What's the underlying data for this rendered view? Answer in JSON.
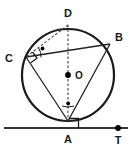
{
  "figure": {
    "type": "circle-geometry-diagram",
    "colors": {
      "stroke": "#222222",
      "circle_stroke": "#1a1a1a",
      "background": "#ffffff",
      "point_fill": "#000000"
    },
    "circle": {
      "label": "circle",
      "center_label": "O",
      "cx": 68,
      "cy": 75,
      "r": 46,
      "stroke_width": 2.2
    },
    "points": [
      {
        "id": "A",
        "label": "A",
        "x": 68,
        "y": 121,
        "label_x": 68,
        "label_y": 140,
        "marker": "none"
      },
      {
        "id": "B",
        "label": "B",
        "x": 110,
        "y": 44,
        "label_x": 119,
        "label_y": 38,
        "marker": "none"
      },
      {
        "id": "C",
        "label": "C",
        "x": 26,
        "y": 57,
        "label_x": 9,
        "label_y": 59,
        "marker": "none"
      },
      {
        "id": "D",
        "label": "D",
        "x": 68,
        "y": 25,
        "label_x": 68,
        "label_y": 14,
        "marker": "none"
      },
      {
        "id": "O",
        "label": "O",
        "x": 68,
        "y": 75,
        "label_x": 79,
        "label_y": 76,
        "marker": "dot"
      },
      {
        "id": "T",
        "label": "T",
        "x": 118,
        "y": 128,
        "label_x": 118,
        "label_y": 141,
        "marker": "dot"
      }
    ],
    "segments": [
      {
        "id": "CB",
        "from": "C",
        "to": "B",
        "style": "solid"
      },
      {
        "id": "CA",
        "from": "C",
        "to": "A",
        "style": "solid"
      },
      {
        "id": "BA",
        "from": "B",
        "to": "A",
        "style": "solid"
      },
      {
        "id": "DC",
        "from": "D",
        "to": "C",
        "style": "dashed"
      },
      {
        "id": "DA",
        "from": "D",
        "to": "A",
        "style": "dashed"
      }
    ],
    "tangent_line": {
      "id": "tangent",
      "label": "tangent line at A",
      "x1": 4,
      "y1": 128,
      "x2": 128,
      "y2": 128
    },
    "angle_marks": [
      {
        "id": "right-angle-at-C",
        "kind": "right-angle",
        "vertex": "C"
      },
      {
        "id": "right-angle-at-A",
        "kind": "right-angle",
        "vertex": "A"
      },
      {
        "id": "marked-angle-at-C",
        "kind": "arc-with-dot",
        "vertex": "C"
      },
      {
        "id": "marked-angle-at-A",
        "kind": "arc-with-dot",
        "vertex": "A"
      }
    ]
  }
}
